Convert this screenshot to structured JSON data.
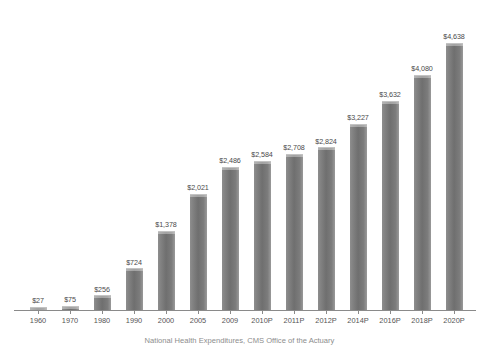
{
  "chart_data": {
    "type": "bar",
    "title": "",
    "subtitle": "",
    "xlabel": "",
    "ylabel": "",
    "grid": false,
    "legend": false,
    "ylim": [
      0,
      5000
    ],
    "categories": [
      "1960",
      "1970",
      "1980",
      "1990",
      "2000",
      "2005",
      "2009",
      "2010P",
      "2011P",
      "2012P",
      "2014P",
      "2016P",
      "2018P",
      "2020P"
    ],
    "values": [
      27,
      75,
      256,
      724,
      1378,
      2021,
      2486,
      2584,
      2708,
      2824,
      3227,
      3632,
      4080,
      4638
    ],
    "data_labels": [
      "$27",
      "$75",
      "$256",
      "$724",
      "$1,378",
      "$2,021",
      "$2,486",
      "$2,584",
      "$2,708",
      "$2,824",
      "$3,227",
      "$3,632",
      "$4,080",
      "$4,638"
    ],
    "bar_color": "#777777",
    "bar_highlight_color": "#c3c3c3",
    "axis_color": "#8a8a8a",
    "label_color": "#555555",
    "background_color": "#ffffff"
  },
  "caption": {
    "text": "National Health Expenditures, CMS Office of the Actuary"
  }
}
